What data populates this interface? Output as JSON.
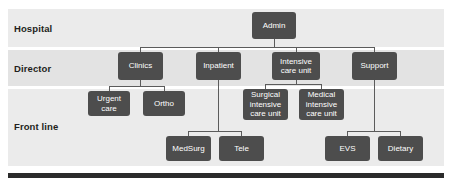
{
  "diagram": {
    "type": "org-chart",
    "colors": {
      "node_fill": "#4d4d4d",
      "node_text": "#ffffff",
      "band_light": "#ebebeb",
      "band_dark": "#e3e3e3",
      "connector": "#5b5b5b",
      "label_text": "#231f20",
      "bottom_bar": "#2b2b2b",
      "page_background": "#ffffff"
    },
    "bands": [
      {
        "id": "hospital",
        "label": "Hospital",
        "x": 8,
        "y": 9,
        "w": 436,
        "h": 38,
        "shade": "light"
      },
      {
        "id": "director",
        "label": "Director",
        "x": 8,
        "y": 50,
        "w": 436,
        "h": 36,
        "shade": "dark"
      },
      {
        "id": "front-line",
        "label": "Front line",
        "x": 8,
        "y": 89,
        "w": 436,
        "h": 77,
        "shade": "light"
      }
    ],
    "band_labels": [
      {
        "id": "hospital",
        "text": "Hospital",
        "x": 14,
        "y": 23
      },
      {
        "id": "director",
        "text": "Director",
        "x": 14,
        "y": 63
      },
      {
        "id": "front-line",
        "text": "Front line",
        "x": 14,
        "y": 121
      }
    ],
    "nodes": [
      {
        "id": "admin",
        "label": "Admin",
        "x": 252,
        "y": 12,
        "w": 44,
        "h": 27,
        "level": "hospital"
      },
      {
        "id": "clinics",
        "label": "Clinics",
        "x": 118,
        "y": 52,
        "w": 45,
        "h": 28,
        "level": "director"
      },
      {
        "id": "inpatient",
        "label": "Inpatient",
        "x": 196,
        "y": 52,
        "w": 45,
        "h": 28,
        "level": "director"
      },
      {
        "id": "icu",
        "label": "Intensive\ncare unit",
        "x": 272,
        "y": 52,
        "w": 48,
        "h": 28,
        "level": "director"
      },
      {
        "id": "support",
        "label": "Support",
        "x": 352,
        "y": 52,
        "w": 45,
        "h": 28,
        "level": "director"
      },
      {
        "id": "urgent-care",
        "label": "Urgent\ncare",
        "x": 88,
        "y": 91,
        "w": 42,
        "h": 25,
        "level": "front-line"
      },
      {
        "id": "ortho",
        "label": "Ortho",
        "x": 143,
        "y": 91,
        "w": 42,
        "h": 25,
        "level": "front-line"
      },
      {
        "id": "sicu",
        "label": "Surgical\nintensive\ncare unit",
        "x": 243,
        "y": 89,
        "w": 45,
        "h": 31,
        "level": "front-line"
      },
      {
        "id": "micu",
        "label": "Medical\nintensive\ncare unit",
        "x": 299,
        "y": 89,
        "w": 45,
        "h": 31,
        "level": "front-line"
      },
      {
        "id": "medsurg",
        "label": "MedSurg",
        "x": 166,
        "y": 136,
        "w": 45,
        "h": 25,
        "level": "front-line"
      },
      {
        "id": "tele",
        "label": "Tele",
        "x": 219,
        "y": 136,
        "w": 45,
        "h": 25,
        "level": "front-line"
      },
      {
        "id": "evs",
        "label": "EVS",
        "x": 325,
        "y": 136,
        "w": 45,
        "h": 25,
        "level": "front-line"
      },
      {
        "id": "dietary",
        "label": "Dietary",
        "x": 378,
        "y": 136,
        "w": 45,
        "h": 25,
        "level": "front-line"
      }
    ],
    "edges": [
      {
        "from": "admin",
        "to": "clinics"
      },
      {
        "from": "admin",
        "to": "inpatient"
      },
      {
        "from": "admin",
        "to": "icu"
      },
      {
        "from": "admin",
        "to": "support"
      },
      {
        "from": "clinics",
        "to": "urgent-care"
      },
      {
        "from": "clinics",
        "to": "ortho"
      },
      {
        "from": "icu",
        "to": "sicu"
      },
      {
        "from": "icu",
        "to": "micu"
      },
      {
        "from": "inpatient",
        "to": "medsurg"
      },
      {
        "from": "inpatient",
        "to": "tele"
      },
      {
        "from": "support",
        "to": "evs"
      },
      {
        "from": "support",
        "to": "dietary"
      }
    ],
    "connector_segments": [
      {
        "id": "admin-stem",
        "orient": "v",
        "x": 274,
        "y": 39,
        "len": 8
      },
      {
        "id": "admin-bus",
        "orient": "h",
        "x": 140,
        "y": 47,
        "len": 235
      },
      {
        "id": "admin-drop-clinics",
        "orient": "v",
        "x": 140,
        "y": 47,
        "len": 6
      },
      {
        "id": "admin-drop-inpat",
        "orient": "v",
        "x": 218,
        "y": 47,
        "len": 6
      },
      {
        "id": "admin-drop-icu",
        "orient": "v",
        "x": 296,
        "y": 47,
        "len": 6
      },
      {
        "id": "admin-drop-support",
        "orient": "v",
        "x": 374,
        "y": 47,
        "len": 6
      },
      {
        "id": "clinics-stem",
        "orient": "v",
        "x": 140,
        "y": 80,
        "len": 6
      },
      {
        "id": "clinics-bus",
        "orient": "h",
        "x": 109,
        "y": 86,
        "len": 56
      },
      {
        "id": "clinics-drop-uc",
        "orient": "v",
        "x": 109,
        "y": 86,
        "len": 6
      },
      {
        "id": "clinics-drop-ortho",
        "orient": "v",
        "x": 164,
        "y": 86,
        "len": 6
      },
      {
        "id": "icu-stem",
        "orient": "v",
        "x": 296,
        "y": 80,
        "len": 4
      },
      {
        "id": "icu-bus",
        "orient": "h",
        "x": 265,
        "y": 84,
        "len": 57
      },
      {
        "id": "icu-drop-sicu",
        "orient": "v",
        "x": 265,
        "y": 84,
        "len": 6
      },
      {
        "id": "icu-drop-micu",
        "orient": "v",
        "x": 321,
        "y": 84,
        "len": 6
      },
      {
        "id": "inpatient-stem",
        "orient": "v",
        "x": 218,
        "y": 80,
        "len": 51
      },
      {
        "id": "inpatient-bus",
        "orient": "h",
        "x": 188,
        "y": 131,
        "len": 54
      },
      {
        "id": "inpat-drop-ms",
        "orient": "v",
        "x": 188,
        "y": 131,
        "len": 6
      },
      {
        "id": "inpat-drop-tele",
        "orient": "v",
        "x": 241,
        "y": 131,
        "len": 6
      },
      {
        "id": "support-stem",
        "orient": "v",
        "x": 374,
        "y": 80,
        "len": 51
      },
      {
        "id": "support-bus",
        "orient": "h",
        "x": 347,
        "y": 131,
        "len": 54
      },
      {
        "id": "support-drop-evs",
        "orient": "v",
        "x": 347,
        "y": 131,
        "len": 6
      },
      {
        "id": "support-drop-diet",
        "orient": "v",
        "x": 400,
        "y": 131,
        "len": 6
      }
    ],
    "bottom_bar": {
      "x": 8,
      "y": 173,
      "w": 436,
      "h": 5
    }
  }
}
